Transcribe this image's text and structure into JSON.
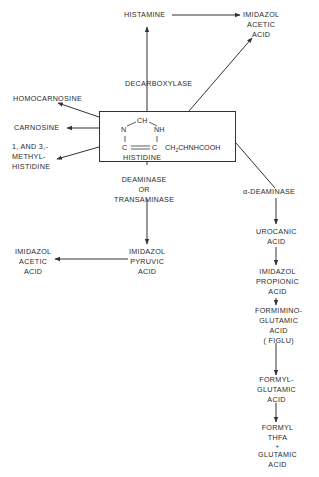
{
  "diagram": {
    "center": {
      "name": "HISTIDINE",
      "structure": {
        "top": "CH",
        "left_n": "N",
        "right_nh": "NH",
        "left_c": "C",
        "right_c": "C",
        "side_chain": "CH",
        "side_chain_sub": "2",
        "side_chain_rest": "CHNHCOOH"
      }
    },
    "nodes": {
      "histamine": [
        "HISTAMINE"
      ],
      "imidazol_acetic_top": [
        "IMIDAZOL",
        "ACETIC",
        "ACID"
      ],
      "decarboxylase": [
        "DECARBOXYLASE"
      ],
      "homocarnosine": [
        "HOMOCARNOSINE"
      ],
      "carnosine": [
        "CARNOSINE"
      ],
      "methylhistidine": [
        "1, AND 3,-",
        "METHYL-",
        "HISTIDINE"
      ],
      "deaminase_or_transaminase": [
        "DEAMINASE",
        "OR",
        "TRANSAMINASE"
      ],
      "alpha_deaminase": [
        "α-DEAMINASE"
      ],
      "imidazol_pyruvic": [
        "IMIDAZOL",
        "PYRUVIC",
        "ACID"
      ],
      "imidazol_acetic_left": [
        "IMIDAZOL",
        "ACETIC",
        "ACID"
      ],
      "urocanic": [
        "UROCANIC",
        "ACID"
      ],
      "imidazol_propionic": [
        "IMIDAZOL",
        "PROPIONIC",
        "ACID"
      ],
      "figlu": [
        "FORMIMINO-",
        "GLUTAMIC",
        "ACID",
        "( FIGLU)"
      ],
      "formylglutamic": [
        "FORMYL-",
        "GLUTAMIC",
        "ACID"
      ],
      "formyl_thfa": [
        "FORMYL",
        "THFA",
        "+",
        "GLUTAMIC",
        "ACID"
      ]
    },
    "edges": [
      {
        "from": "histidine",
        "to": "histamine",
        "label": "DECARBOXYLASE"
      },
      {
        "from": "histamine",
        "to": "imidazol_acetic_top"
      },
      {
        "from": "histidine",
        "to": "imidazol_acetic_top"
      },
      {
        "from": "histidine",
        "to": "homocarnosine"
      },
      {
        "from": "histidine",
        "to": "carnosine"
      },
      {
        "from": "histidine",
        "to": "methylhistidine"
      },
      {
        "from": "histidine",
        "to": "imidazol_pyruvic",
        "label": "DEAMINASE OR TRANSAMINASE"
      },
      {
        "from": "imidazol_pyruvic",
        "to": "imidazol_acetic_left"
      },
      {
        "from": "histidine",
        "to": "urocanic",
        "label": "α-DEAMINASE"
      },
      {
        "from": "urocanic",
        "to": "imidazol_propionic"
      },
      {
        "from": "imidazol_propionic",
        "to": "figlu"
      },
      {
        "from": "figlu",
        "to": "formylglutamic"
      },
      {
        "from": "formylglutamic",
        "to": "formyl_thfa"
      }
    ]
  }
}
